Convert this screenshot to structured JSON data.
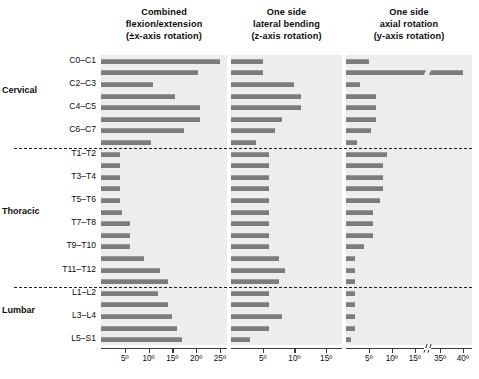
{
  "figure": {
    "panels": [
      {
        "id": "p1",
        "line1": "Combined",
        "line2": "flexion/extension",
        "line3": "(±x-axis rotation)",
        "ticks": [
          "5º",
          "10º",
          "15º",
          "20º",
          "25º"
        ],
        "tick_values": [
          5,
          10,
          15,
          20,
          25
        ],
        "axis_max": 26.5,
        "has_break": false
      },
      {
        "id": "p2",
        "line1": "One side",
        "line2": "lateral bending",
        "line3": "(z-axis rotation)",
        "ticks": [
          "5º",
          "10º",
          "15º"
        ],
        "tick_values": [
          5,
          10,
          15
        ],
        "axis_max": 17.5,
        "has_break": false
      },
      {
        "id": "p3",
        "line1": "One side",
        "line2": "axial rotation",
        "line3": "(y-axis rotation)",
        "ticks": [
          "5º",
          "10º",
          "15º",
          "35º",
          "40º"
        ],
        "tick_values": [
          5,
          10,
          15,
          35,
          40
        ],
        "axis_max": 42,
        "has_break": true,
        "break_after": 17,
        "break_resume": 33
      }
    ],
    "groups": [
      {
        "label": "Cervical"
      },
      {
        "label": "Thoracic"
      },
      {
        "label": "Lumbar"
      }
    ],
    "levels": [
      "C0–C1",
      "C1–C2",
      "C2–C3",
      "C3–C4",
      "C4–C5",
      "C5–C6",
      "C6–C7",
      "C7–T1",
      "T1–T2",
      "T2–T3",
      "T3–T4",
      "T4–T5",
      "T5–T6",
      "T6–T7",
      "T7–T8",
      "T8–T9",
      "T9–T10",
      "T10–T11",
      "T11–T12",
      "T12–L1",
      "L1–L2",
      "L2–L3",
      "L3–L4",
      "L4–L5",
      "L5–S1"
    ],
    "visible_level_labels": [
      "C0–C1",
      "C2–C3",
      "C4–C5",
      "C6–C7",
      "T1–T2",
      "T3–T4",
      "T5–T6",
      "T7–T8",
      "T9–T10",
      "T11–T12",
      "L1–L2",
      "L3–L4",
      "L5–S1"
    ],
    "colors": {
      "bar": "#7c7c7c",
      "bar_top": "#9a9a9a",
      "panel_bg": "#eceded",
      "axis": "#3a3a3a",
      "text": "#0d0d0d",
      "divider": "#1f1f1f"
    }
  },
  "chart_data": {
    "type": "bar",
    "orientation": "horizontal",
    "xlabel": "Range of motion (degrees)",
    "ylabel": "Spinal level",
    "grid": false,
    "legend": "none",
    "categories": [
      "C0–C1",
      "C1–C2",
      "C2–C3",
      "C3–C4",
      "C4–C5",
      "C5–C6",
      "C6–C7",
      "C7–T1",
      "T1–T2",
      "T2–T3",
      "T3–T4",
      "T4–T5",
      "T5–T6",
      "T6–T7",
      "T7–T8",
      "T8–T9",
      "T9–T10",
      "T10–T11",
      "T11–T12",
      "T12–L1",
      "L1–L2",
      "L2–L3",
      "L3–L4",
      "L4–L5",
      "L5–S1"
    ],
    "group_breaks_after": [
      "C7–T1",
      "T12–L1"
    ],
    "series": [
      {
        "name": "Combined flexion/extension (±x-axis rotation)",
        "unit": "degrees",
        "xlim": [
          0,
          26.5
        ],
        "values": [
          25.0,
          20.5,
          11.0,
          15.5,
          20.9,
          20.9,
          17.5,
          10.5,
          4.0,
          4.0,
          4.0,
          4.0,
          4.0,
          4.5,
          6.0,
          6.0,
          6.0,
          9.0,
          12.5,
          14.0,
          12.0,
          14.0,
          15.0,
          16.0,
          17.0
        ]
      },
      {
        "name": "One side lateral bending (z-axis rotation)",
        "unit": "degrees",
        "xlim": [
          0,
          17.5
        ],
        "values": [
          5.0,
          5.0,
          10.0,
          11.0,
          11.0,
          8.0,
          7.0,
          4.0,
          6.0,
          6.0,
          6.0,
          6.0,
          6.0,
          6.0,
          6.0,
          6.0,
          6.0,
          7.5,
          8.5,
          7.5,
          6.0,
          6.0,
          8.0,
          6.0,
          3.0
        ]
      },
      {
        "name": "One side axial rotation (y-axis rotation)",
        "unit": "degrees",
        "xlim": [
          0,
          42
        ],
        "break": {
          "after": 17,
          "resume": 33
        },
        "values": [
          5.0,
          40.0,
          3.0,
          6.5,
          6.5,
          6.5,
          5.5,
          2.5,
          9.0,
          8.0,
          8.0,
          8.0,
          7.5,
          6.0,
          6.0,
          6.0,
          4.0,
          2.0,
          2.0,
          2.0,
          2.0,
          2.0,
          2.0,
          2.0,
          1.0
        ]
      }
    ]
  }
}
